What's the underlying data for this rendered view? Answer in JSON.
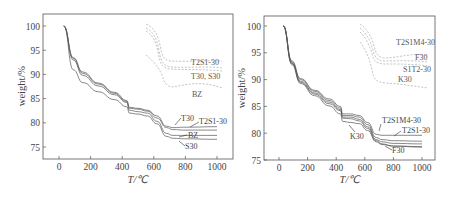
{
  "chart_data": [
    {
      "type": "line",
      "title": "",
      "xlabel": "T/℃",
      "ylabel": "weight/%",
      "xlim": [
        -100,
        1100
      ],
      "ylim": [
        72.5,
        102.5
      ],
      "x_ticks": [
        0,
        200,
        400,
        600,
        800,
        1000
      ],
      "y_ticks": [
        75,
        80,
        85,
        90,
        95,
        100
      ],
      "x_tick_labels": [
        "0",
        "200",
        "400",
        "600",
        "800",
        "1000"
      ],
      "y_tick_labels": [
        "75",
        "80",
        "85",
        "90",
        "95",
        "100"
      ],
      "grid": false,
      "series": [
        {
          "name": "T30",
          "x": [
            30,
            90,
            150,
            250,
            350,
            430,
            445,
            500,
            560,
            620,
            680,
            720,
            800,
            1000
          ],
          "y": [
            100,
            93.5,
            90.5,
            88.2,
            86.3,
            84.6,
            83.2,
            83.0,
            82.6,
            81.4,
            79.3,
            79.0,
            79.1,
            79.2
          ]
        },
        {
          "name": "T2S1-30",
          "x": [
            30,
            90,
            150,
            250,
            350,
            430,
            445,
            500,
            560,
            620,
            680,
            720,
            800,
            1000
          ],
          "y": [
            100,
            93.3,
            90.2,
            88.0,
            86.1,
            84.4,
            83.0,
            82.8,
            82.4,
            81.0,
            79.0,
            78.6,
            78.5,
            78.5
          ]
        },
        {
          "name": "BZ",
          "x": [
            30,
            90,
            150,
            250,
            350,
            430,
            445,
            500,
            560,
            620,
            680,
            720,
            800,
            1000
          ],
          "y": [
            100,
            93.0,
            89.8,
            87.6,
            85.8,
            84.2,
            82.6,
            82.3,
            82.0,
            80.3,
            77.8,
            77.4,
            77.4,
            77.4
          ]
        },
        {
          "name": "S30",
          "x": [
            30,
            90,
            150,
            250,
            350,
            430,
            445,
            500,
            560,
            620,
            680,
            720,
            800,
            1000
          ],
          "y": [
            100,
            91.0,
            88.3,
            86.4,
            84.8,
            83.3,
            82.0,
            81.8,
            81.4,
            79.8,
            77.2,
            76.8,
            76.7,
            76.6
          ]
        }
      ],
      "annotations": [
        "T2S1-30",
        "T30, S30",
        "BZ",
        "T30",
        "T2S1-30",
        "BZ",
        "S30"
      ],
      "inset_note": "dashed DTG-like inset curves in upper-right region labeled T2S1-30, T30, S30, BZ"
    },
    {
      "type": "line",
      "title": "",
      "xlabel": "T/℃",
      "ylabel": "weight/%",
      "xlim": [
        -100,
        1100
      ],
      "ylim": [
        75,
        102
      ],
      "x_ticks": [
        0,
        200,
        400,
        600,
        800,
        1000
      ],
      "y_ticks": [
        75,
        80,
        85,
        90,
        95,
        100
      ],
      "x_tick_labels": [
        "0",
        "200",
        "400",
        "600",
        "800",
        "1000"
      ],
      "y_tick_labels": [
        "75",
        "80",
        "85",
        "90",
        "95",
        "100"
      ],
      "grid": false,
      "series": [
        {
          "name": "T2S1M4-30",
          "x": [
            30,
            90,
            150,
            250,
            350,
            430,
            445,
            500,
            560,
            620,
            680,
            720,
            800,
            1000
          ],
          "y": [
            100,
            93.5,
            90.2,
            88.0,
            86.4,
            85.0,
            83.6,
            83.6,
            83.3,
            82.0,
            79.8,
            79.6,
            79.6,
            79.6
          ]
        },
        {
          "name": "T2S1-30",
          "x": [
            30,
            90,
            150,
            250,
            350,
            430,
            445,
            500,
            560,
            620,
            680,
            720,
            800,
            1000
          ],
          "y": [
            100,
            93.3,
            90.0,
            87.8,
            86.1,
            84.7,
            83.3,
            83.3,
            83.0,
            81.6,
            79.2,
            78.8,
            78.6,
            78.5
          ]
        },
        {
          "name": "S1T2-30",
          "x": [
            30,
            90,
            150,
            250,
            350,
            430,
            445,
            500,
            560,
            620,
            680,
            720,
            800,
            1000
          ],
          "y": [
            100,
            93.1,
            89.7,
            87.5,
            85.8,
            84.4,
            83.0,
            83.0,
            82.6,
            81.2,
            78.8,
            78.4,
            78.1,
            78.0
          ]
        },
        {
          "name": "F30",
          "x": [
            30,
            90,
            150,
            250,
            350,
            430,
            445,
            500,
            560,
            620,
            680,
            720,
            800,
            1000
          ],
          "y": [
            100,
            93.0,
            89.5,
            87.3,
            85.5,
            84.2,
            82.8,
            82.7,
            82.3,
            80.9,
            78.6,
            78.0,
            77.6,
            77.4
          ]
        },
        {
          "name": "K30",
          "x": [
            30,
            90,
            150,
            250,
            350,
            430,
            445,
            500,
            560,
            620,
            680,
            720,
            800,
            1000
          ],
          "y": [
            100,
            92.8,
            89.3,
            87.0,
            85.1,
            83.6,
            82.2,
            82.0,
            81.8,
            80.5,
            78.4,
            77.9,
            77.6,
            77.5
          ]
        }
      ],
      "annotations": [
        "T2S1M4-30",
        "F30",
        "S1T2-30",
        "K30",
        "T2S1M4-30",
        "T2S1-30",
        "K30",
        "F30"
      ],
      "inset_note": "dashed DTG-like inset curves in upper-right region labeled T2S1M4-30, F30, S1T2-30, K30"
    }
  ]
}
